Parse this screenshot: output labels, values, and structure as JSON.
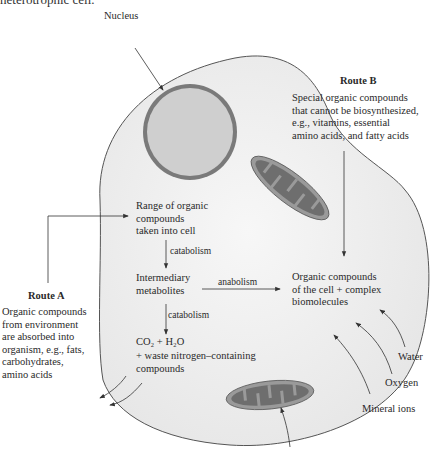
{
  "heading_cut": "heterotrophic cell.",
  "labels": {
    "nucleus": "Nucleus",
    "route_b_title": "Route B",
    "route_b_text": [
      "Special organic compounds",
      "that cannot be biosynthesized,",
      "e.g., vitamins, essential",
      "amino acids, and fatty acids"
    ],
    "range": [
      "Range of organic",
      "compounds",
      "taken into cell"
    ],
    "catabolism1": "catabolism",
    "intermediary": [
      "Intermediary",
      "metabolites"
    ],
    "anabolism": "anabolism",
    "organic_cell": [
      "Organic compounds",
      "of the cell + complex",
      "biomolecules"
    ],
    "catabolism2": "catabolism",
    "co2_line": "CO₂ + H₂O",
    "waste": [
      "+ waste nitrogen–containing",
      "compounds"
    ],
    "route_a_title": "Route A",
    "route_a_text": [
      "Organic compounds",
      "from environment",
      "are absorbed into",
      "organism, e.g., fats,",
      "carbohydrates,",
      "amino acids"
    ],
    "water": "Water",
    "oxygen": "Oxygen",
    "mineral_ions": "Mineral ions"
  },
  "colors": {
    "cell_fill": "#f1f1f1",
    "cell_stroke": "#555555",
    "nucleus_fill": "#cfcfcf",
    "nucleus_ring": "#7a7a7a",
    "mito_outer": "#9a9a9a",
    "mito_inner": "#6e6e6e"
  }
}
